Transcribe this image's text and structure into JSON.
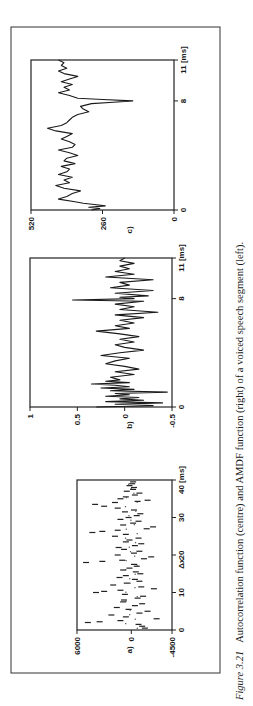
{
  "figure": {
    "rotation_deg": -90,
    "caption_label": "Figure 3.21",
    "caption_text": "Autocorrelation function (centre) and AMDF function (right) of a voiced speech segment (left)."
  },
  "chart_data": [
    {
      "id": "a",
      "panel_label": "a)",
      "type": "scatter",
      "title": "Voiced speech segment",
      "xlabel": "Δx",
      "x_unit": "[ms]",
      "ylabel": "",
      "xlim": [
        0,
        40
      ],
      "ylim": [
        -4500,
        6000
      ],
      "x_ticks": [
        0,
        10,
        20,
        30,
        40
      ],
      "x_tick_labels": [
        "0",
        "10",
        "20",
        "30",
        "40 [ms]"
      ],
      "y_ticks": [
        6000,
        0,
        -4500
      ],
      "y_tick_labels": [
        "6000",
        "0",
        "-4500"
      ],
      "grid": false,
      "x": [
        0.5,
        1,
        1.5,
        2,
        2.2,
        2.5,
        3,
        3.5,
        4,
        4.5,
        5,
        5.5,
        6,
        6.5,
        7,
        7.5,
        8,
        8.5,
        9,
        9.5,
        10,
        10.3,
        10.6,
        11,
        11.5,
        12,
        12.5,
        13,
        13.5,
        14,
        14.5,
        15,
        15.5,
        16,
        16.5,
        17,
        17.5,
        18,
        18.3,
        18.6,
        19,
        19.5,
        20,
        20.5,
        21,
        21.5,
        22,
        22.5,
        23,
        23.5,
        24,
        24.5,
        25,
        25.5,
        26,
        26.3,
        26.6,
        27,
        27.5,
        28,
        28.5,
        29,
        29.5,
        30,
        30.5,
        31,
        31.5,
        32,
        32.5,
        33,
        33.5,
        34,
        34.3,
        34.6,
        35,
        35.5,
        36,
        36.5,
        37,
        37.5,
        38,
        38.5,
        39,
        39.5
      ],
      "y": [
        -1500,
        -1200,
        -800,
        4800,
        3500,
        1200,
        -2800,
        600,
        2200,
        -900,
        -1800,
        300,
        1600,
        -400,
        -1200,
        900,
        800,
        -700,
        -1300,
        700,
        3900,
        3000,
        1200,
        -2500,
        -1100,
        2000,
        500,
        -900,
        -400,
        1300,
        600,
        -1000,
        -500,
        900,
        200,
        -600,
        -300,
        5000,
        3200,
        1000,
        -1400,
        -2200,
        1500,
        -300,
        -900,
        800,
        1400,
        -400,
        -1100,
        600,
        200,
        -800,
        1800,
        600,
        4300,
        3200,
        1500,
        -1700,
        -2400,
        900,
        -200,
        -800,
        1200,
        300,
        -600,
        -1000,
        700,
        -300,
        1500,
        3000,
        4000,
        1800,
        -700,
        -1800,
        1200,
        600,
        -400,
        -900,
        500,
        -200,
        -300,
        200,
        -100,
        -200
      ]
    },
    {
      "id": "b",
      "panel_label": "b)",
      "type": "line",
      "title": "Autocorrelation function",
      "xlabel": "",
      "x_unit": "[ms]",
      "ylabel": "",
      "xlim": [
        0,
        11
      ],
      "ylim": [
        -0.5,
        1
      ],
      "x_ticks": [
        0,
        8,
        11
      ],
      "x_tick_labels": [
        "0",
        "8",
        "11 [ms]"
      ],
      "y_ticks": [
        1,
        0.5,
        0,
        -0.5
      ],
      "y_tick_labels": [
        "1",
        "0.5",
        "0",
        "-0.5"
      ],
      "grid": false,
      "x": [
        0,
        0.1,
        0.2,
        0.3,
        0.4,
        0.5,
        0.6,
        0.7,
        0.8,
        0.9,
        1.0,
        1.1,
        1.2,
        1.3,
        1.4,
        1.5,
        1.6,
        1.7,
        1.8,
        1.9,
        2.0,
        2.2,
        2.4,
        2.6,
        2.8,
        3.0,
        3.2,
        3.4,
        3.6,
        3.8,
        4.0,
        4.2,
        4.4,
        4.6,
        4.8,
        5.0,
        5.2,
        5.4,
        5.6,
        5.8,
        6.0,
        6.2,
        6.4,
        6.6,
        6.8,
        7.0,
        7.2,
        7.4,
        7.6,
        7.8,
        7.9,
        8.0,
        8.1,
        8.2,
        8.4,
        8.6,
        8.8,
        9.0,
        9.2,
        9.4,
        9.6,
        9.8,
        10.0,
        10.2,
        10.4,
        10.6,
        10.8,
        11.0
      ],
      "y": [
        0.3,
        -0.3,
        0.1,
        -0.4,
        0.2,
        -0.2,
        0.05,
        -0.15,
        0.2,
        -0.05,
        0.1,
        -0.45,
        0.15,
        -0.1,
        0.25,
        -0.05,
        0.1,
        0.35,
        -0.05,
        0.2,
        0.05,
        0.15,
        -0.1,
        0.1,
        -0.15,
        0.0,
        0.2,
        0.1,
        -0.05,
        0.25,
        0.05,
        -0.2,
        0.0,
        0.1,
        -0.1,
        0.05,
        -0.15,
        0.05,
        0.3,
        -0.05,
        0.1,
        -0.1,
        0.05,
        -0.2,
        0.1,
        -0.35,
        0.05,
        -0.1,
        0.1,
        -0.2,
        0.55,
        -0.1,
        0.05,
        -0.25,
        0.1,
        -0.3,
        0.15,
        -0.05,
        0.05,
        -0.3,
        0.2,
        -0.1,
        0.1,
        -0.05,
        0.05,
        -0.1,
        0.05,
        0.0
      ]
    },
    {
      "id": "c",
      "panel_label": "c)",
      "type": "line",
      "title": "AMDF function",
      "xlabel": "",
      "x_unit": "[ms]",
      "ylabel": "",
      "xlim": [
        0,
        11
      ],
      "ylim": [
        0,
        520
      ],
      "x_ticks": [
        0,
        8,
        11
      ],
      "x_tick_labels": [
        "0",
        "8",
        "11 [ms]"
      ],
      "y_ticks": [
        520,
        260,
        0
      ],
      "y_tick_labels": [
        "520",
        "260",
        "0"
      ],
      "grid": false,
      "x": [
        0,
        0.1,
        0.2,
        0.3,
        0.4,
        0.5,
        0.6,
        0.8,
        1.0,
        1.2,
        1.4,
        1.6,
        1.8,
        2.0,
        2.2,
        2.4,
        2.6,
        2.8,
        3.0,
        3.2,
        3.4,
        3.6,
        3.8,
        4.0,
        4.2,
        4.4,
        4.6,
        4.8,
        5.0,
        5.2,
        5.4,
        5.6,
        5.8,
        6.0,
        6.2,
        6.4,
        6.6,
        6.8,
        7.0,
        7.2,
        7.4,
        7.6,
        7.8,
        7.9,
        8.0,
        8.1,
        8.2,
        8.4,
        8.6,
        8.8,
        9.0,
        9.2,
        9.4,
        9.6,
        9.8,
        10.0,
        10.2,
        10.4,
        10.6,
        10.8,
        11.0
      ],
      "y": [
        300,
        270,
        310,
        250,
        290,
        330,
        360,
        420,
        390,
        370,
        340,
        400,
        430,
        380,
        400,
        370,
        420,
        390,
        380,
        410,
        360,
        400,
        390,
        350,
        380,
        420,
        370,
        360,
        380,
        410,
        390,
        370,
        430,
        460,
        410,
        390,
        380,
        370,
        350,
        310,
        330,
        340,
        300,
        220,
        150,
        260,
        350,
        380,
        420,
        380,
        400,
        370,
        410,
        380,
        350,
        400,
        420,
        390,
        410,
        400,
        420
      ]
    }
  ]
}
